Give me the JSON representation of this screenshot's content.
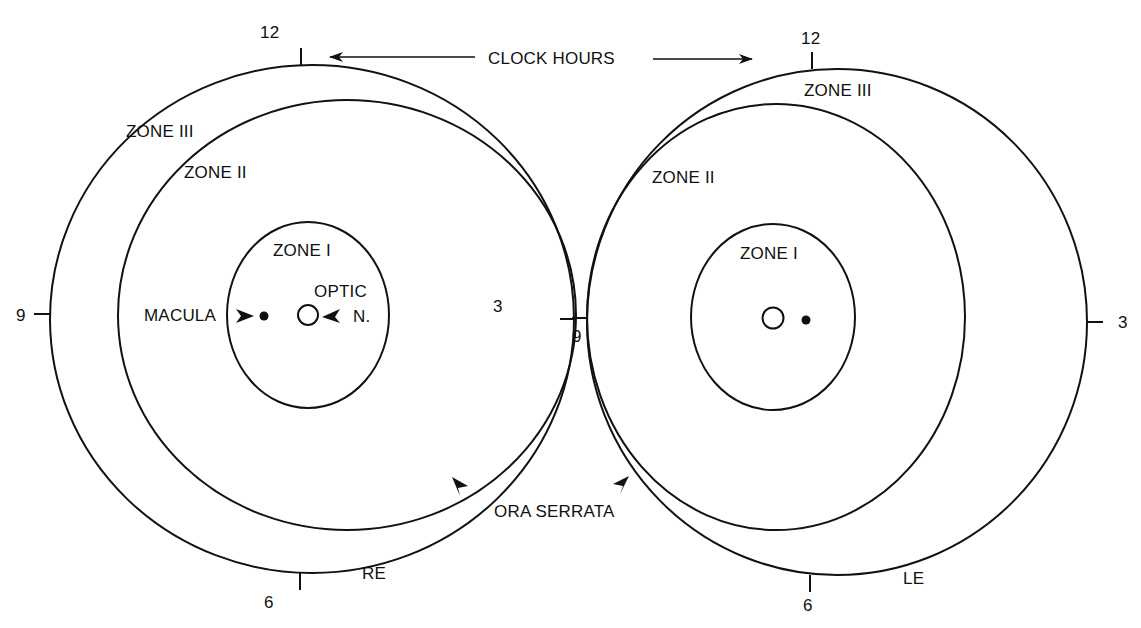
{
  "header": {
    "clock_hours_label": "CLOCK HOURS"
  },
  "right_eye": {
    "eye_label": "RE",
    "clock": {
      "twelve": "12",
      "three": "3",
      "six": "6",
      "nine": "9"
    },
    "zones": {
      "zone1": "ZONE I",
      "zone2": "ZONE II",
      "zone3": "ZONE III"
    },
    "macula_label": "MACULA",
    "optic_label_line1": "OPTIC",
    "optic_label_line2": "N."
  },
  "left_eye": {
    "eye_label": "LE",
    "clock": {
      "twelve": "12",
      "three": "3",
      "six": "6",
      "nine": "9"
    },
    "zones": {
      "zone1": "ZONE I",
      "zone2": "ZONE II",
      "zone3": "ZONE III"
    }
  },
  "shared": {
    "ora_serrata_label": "ORA SERRATA"
  },
  "colors": {
    "stroke": "#111111",
    "background": "#ffffff"
  }
}
